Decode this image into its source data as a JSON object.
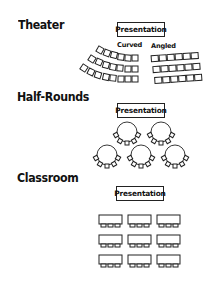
{
  "sections": [
    {
      "title": "Theater",
      "presentation_label": "Presentation",
      "sub_labels": [
        "Curved",
        "Angled"
      ],
      "curved": {
        "rows": 3,
        "chairs_per_row": 6
      },
      "angled": {
        "rows": 3,
        "chairs_per_row": 6
      }
    },
    {
      "title": "Half-Rounds",
      "presentation_label": "Presentation",
      "tables": {
        "rows": [
          2,
          3
        ],
        "chairs_per_table": 5
      }
    },
    {
      "title": "Classroom",
      "presentation_label": "Presentation",
      "desks": {
        "rows": 3,
        "columns": 3,
        "chairs_per_desk": 3
      }
    }
  ],
  "colors": {
    "line": "#222222",
    "background": "#ffffff"
  }
}
